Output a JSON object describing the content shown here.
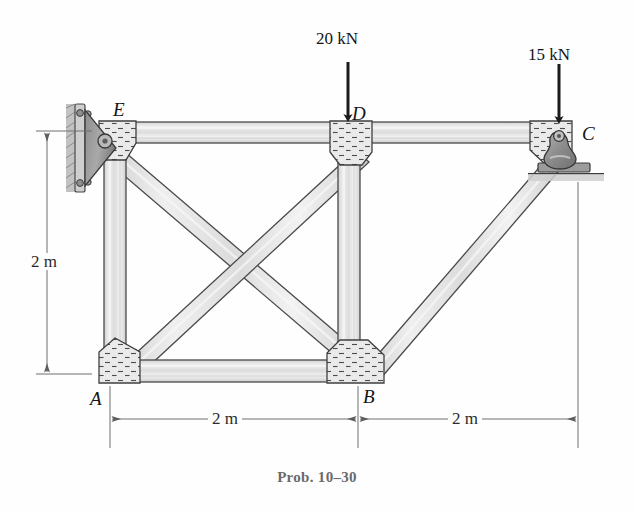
{
  "figure": {
    "caption": "Prob. 10–30"
  },
  "joints": [
    {
      "id": "A",
      "label": "A",
      "x": 0,
      "y": 0,
      "px": 112,
      "py": 372,
      "type": "gusset"
    },
    {
      "id": "B",
      "label": "B",
      "x": 2,
      "y": 0,
      "px": 360,
      "py": 372,
      "type": "gusset"
    },
    {
      "id": "C",
      "label": "C",
      "x": 4,
      "y": 2,
      "px": 560,
      "py": 133,
      "type": "rocker-support"
    },
    {
      "id": "D",
      "label": "D",
      "x": 2,
      "y": 2,
      "px": 348,
      "py": 133,
      "type": "gusset"
    },
    {
      "id": "E",
      "label": "E",
      "x": 0,
      "y": 2,
      "px": 120,
      "py": 133,
      "type": "pin-support"
    }
  ],
  "members": [
    {
      "from": "E",
      "to": "D",
      "name": "top-chord-ed"
    },
    {
      "from": "D",
      "to": "C",
      "name": "top-chord-dc"
    },
    {
      "from": "A",
      "to": "B",
      "name": "bottom-chord-ab"
    },
    {
      "from": "E",
      "to": "A",
      "name": "vertical-ea"
    },
    {
      "from": "D",
      "to": "B",
      "name": "vertical-db"
    },
    {
      "from": "E",
      "to": "B",
      "name": "diagonal-eb"
    },
    {
      "from": "A",
      "to": "D",
      "name": "diagonal-ad"
    },
    {
      "from": "B",
      "to": "C",
      "name": "diagonal-bc"
    }
  ],
  "loads": [
    {
      "id": "load-d",
      "magnitude": "20 kN",
      "at_joint": "D",
      "direction": "down"
    },
    {
      "id": "load-c",
      "magnitude": "15 kN",
      "at_joint": "C",
      "direction": "down"
    }
  ],
  "dimensions": [
    {
      "id": "dim-height",
      "value": "2 m",
      "orientation": "vertical",
      "spans": "A to E"
    },
    {
      "id": "dim-span-ab",
      "value": "2 m",
      "orientation": "horizontal",
      "spans": "A to B"
    },
    {
      "id": "dim-span-bc",
      "value": "2 m",
      "orientation": "horizontal",
      "spans": "B to C"
    }
  ],
  "supports": [
    {
      "id": "support-e",
      "kind": "pin-on-wall-bracket",
      "joint": "E"
    },
    {
      "id": "support-c",
      "kind": "rocker-on-base-plate",
      "joint": "C"
    }
  ],
  "colors": {
    "member_fill": "#dcdcdc",
    "member_outline": "#4a4a4a",
    "gusset_fill": "#e8e8e8",
    "support_fill": "#9a9a9a",
    "dimension_line": "#6f6f6f",
    "caption": "#6a6a6a",
    "background": "#fefefe"
  }
}
